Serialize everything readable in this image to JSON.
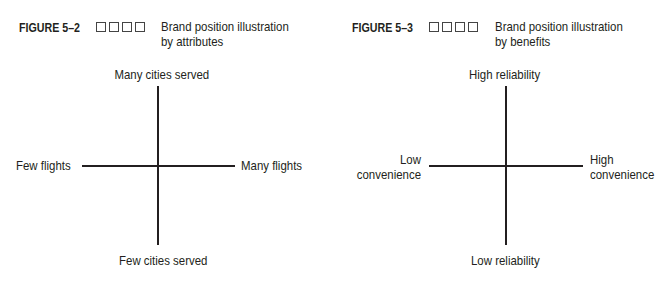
{
  "figures": [
    {
      "number": "FIGURE 5–2",
      "title_line1": "Brand position illustration",
      "title_line2": "by attributes",
      "axes": {
        "top": "Many cities served",
        "bottom": "Few cities served",
        "left": "Few flights",
        "right": "Many flights"
      }
    },
    {
      "number": "FIGURE 5–3",
      "title_line1": "Brand position illustration",
      "title_line2": "by benefits",
      "axes": {
        "top": "High reliability",
        "bottom": "Low reliability",
        "left_line1": "Low",
        "left_line2": "convenience",
        "right_line1": "High",
        "right_line2": "convenience"
      }
    }
  ]
}
